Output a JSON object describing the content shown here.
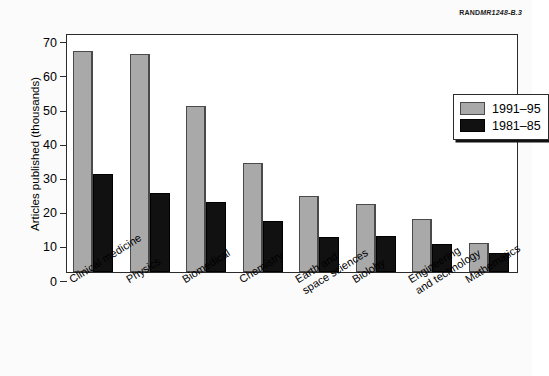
{
  "source_credit": {
    "prefix": "RAND",
    "code": "MR1248-B.3"
  },
  "chart_data": {
    "type": "bar",
    "title": "",
    "xlabel": "",
    "ylabel": "Articles published (thousands)",
    "ylim": [
      0,
      70
    ],
    "ytick_step": 10,
    "yticks": [
      70,
      60,
      50,
      40,
      30,
      20,
      10,
      0
    ],
    "grid": false,
    "legend_position": "upper right",
    "categories": [
      "Clinical medicine",
      "Physics",
      "Biomedical",
      "Chemistry",
      "Earth and space sciences",
      "Bioloby",
      "Engineering and technology",
      "Mathematics"
    ],
    "category_lines": [
      [
        "Clinical medicine"
      ],
      [
        "Physics"
      ],
      [
        "Biomedical"
      ],
      [
        "Chemistry"
      ],
      [
        "Earth and",
        "space sciences"
      ],
      [
        "Bioloby"
      ],
      [
        "Engineering",
        "and technology"
      ],
      [
        "Mathematics"
      ]
    ],
    "series": [
      {
        "name": "1991–95",
        "color": "#a9a9a9",
        "values": [
          64.8,
          64.0,
          48.7,
          31.8,
          22.3,
          20.0,
          15.6,
          8.4
        ]
      },
      {
        "name": "1981–85",
        "color": "#111111",
        "values": [
          28.6,
          23.2,
          20.6,
          15.0,
          10.4,
          10.6,
          8.3,
          5.7
        ]
      }
    ]
  }
}
